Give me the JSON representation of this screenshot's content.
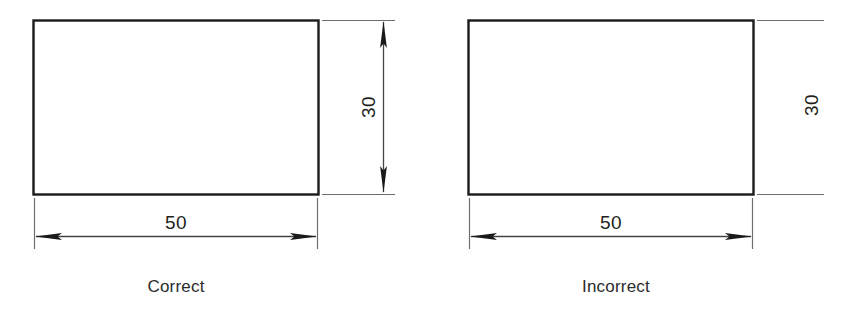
{
  "figure": {
    "kind": "engineering-dimensioning-comparison",
    "background_color": "#ffffff",
    "outline_color": "#1a1a1a",
    "dimension_line_color": "#6e6e6e",
    "text_color": "#231f20",
    "caption_color": "#2b2b2b"
  },
  "panels": [
    {
      "id": "correct",
      "caption": "Correct",
      "rect": {
        "x": 33,
        "y": 20,
        "width": 285,
        "height": 174
      },
      "dimensions": [
        {
          "id": "width-dimension",
          "orientation": "horizontal",
          "value": "50",
          "has_dimension_line": true,
          "has_arrowheads": true,
          "arrowheads": "both-ends",
          "line_y": 236,
          "from_x": 35,
          "to_x": 318,
          "label_x": 176,
          "label_y": 229
        },
        {
          "id": "height-dimension",
          "orientation": "vertical",
          "value": "30",
          "has_dimension_line": true,
          "has_arrowheads": true,
          "arrowheads": "both-ends",
          "line_x": 383,
          "from_y": 20,
          "to_y": 194,
          "label_x": 370,
          "label_y": 107,
          "label_rotation": -90
        }
      ]
    },
    {
      "id": "incorrect",
      "caption": "Incorrect",
      "rect": {
        "x": 468,
        "y": 20,
        "width": 285,
        "height": 174
      },
      "dimensions": [
        {
          "id": "width-dimension",
          "orientation": "horizontal",
          "value": "50",
          "has_dimension_line": true,
          "has_arrowheads": true,
          "arrowheads": "both-ends",
          "line_y": 236,
          "from_x": 470,
          "to_x": 753,
          "label_x": 611,
          "label_y": 229
        },
        {
          "id": "height-dimension",
          "orientation": "vertical",
          "value": "30",
          "has_dimension_line": false,
          "has_arrowheads": false,
          "arrowheads": "none",
          "line_x": 812,
          "from_y": 20,
          "to_y": 194,
          "label_x": 818,
          "label_y": 105,
          "label_rotation": -90
        }
      ]
    }
  ]
}
